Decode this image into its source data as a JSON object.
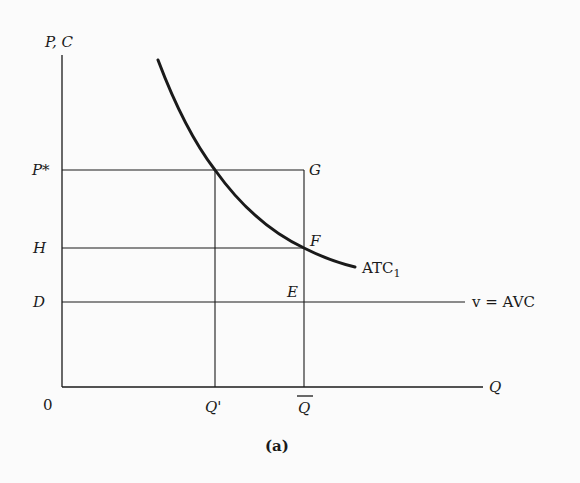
{
  "figure": {
    "caption": "(a)",
    "axes": {
      "y_label": "P, C",
      "x_label": "Q",
      "origin": "0"
    },
    "y_levels": [
      {
        "label": "P*",
        "y": 170
      },
      {
        "label": "H",
        "y": 248
      },
      {
        "label": "D",
        "y": 302
      }
    ],
    "x_levels": [
      {
        "label": "Q'",
        "x": 215
      },
      {
        "label": "Q",
        "x": 304,
        "overline": true
      }
    ],
    "points": [
      {
        "label": "G"
      },
      {
        "label": "F"
      },
      {
        "label": "E"
      }
    ],
    "curves": {
      "atc_label": "ATC",
      "atc_subscript": "1",
      "avc_label": "v = AVC"
    },
    "colors": {
      "ink": "#1a1a1a",
      "background": "#fbfbfb"
    }
  }
}
